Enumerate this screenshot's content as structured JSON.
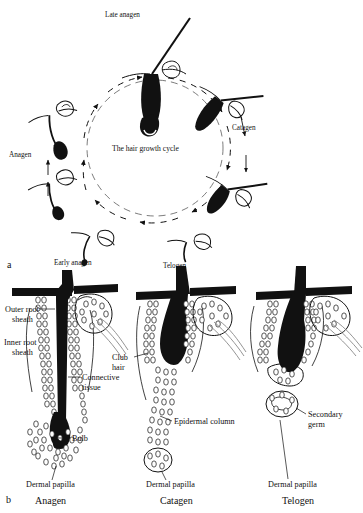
{
  "figure": {
    "panels": [
      {
        "id": "a",
        "letter": "a"
      },
      {
        "id": "b",
        "letter": "b"
      }
    ]
  },
  "panel_a": {
    "letter": "a",
    "center_label": "The hair growth cycle",
    "stage_labels": [
      {
        "name": "late-anagen",
        "text": "Late anagen"
      },
      {
        "name": "catagen",
        "text": "Catagen"
      },
      {
        "name": "telogen",
        "text": "Telogen"
      },
      {
        "name": "early-anagen",
        "text": "Early anagen"
      },
      {
        "name": "anagen",
        "text": "Anagen"
      }
    ]
  },
  "panel_b": {
    "letter": "b",
    "columns": [
      {
        "name": "anagen",
        "caption": "Anagen",
        "labels": [
          {
            "name": "outer-root-sheath",
            "line1": "Outer root",
            "line2": "sheath"
          },
          {
            "name": "inner-root-sheath",
            "line1": "Inner root",
            "line2": "sheath"
          },
          {
            "name": "connective-tissue",
            "line1": "Connective",
            "line2": "tissue"
          },
          {
            "name": "bulb",
            "line1": "Bulb",
            "line2": ""
          },
          {
            "name": "dermal-papilla",
            "line1": "Dermal papilla",
            "line2": ""
          }
        ]
      },
      {
        "name": "catagen",
        "caption": "Catagen",
        "labels": [
          {
            "name": "club-hair",
            "line1": "Club",
            "line2": "hair"
          },
          {
            "name": "epidermal-column",
            "line1": "Epidermal column",
            "line2": ""
          },
          {
            "name": "dermal-papilla",
            "line1": "Dermal papilla",
            "line2": ""
          }
        ]
      },
      {
        "name": "telogen",
        "caption": "Telogen",
        "labels": [
          {
            "name": "secondary-germ",
            "line1": "Secondary",
            "line2": "germ"
          },
          {
            "name": "dermal-papilla",
            "line1": "Dermal papilla",
            "line2": ""
          }
        ]
      }
    ]
  },
  "colors": {
    "ink": "#111111",
    "background": "#ffffff",
    "hair": "#000000"
  }
}
